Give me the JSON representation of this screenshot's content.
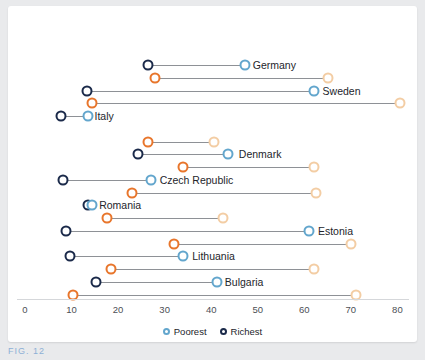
{
  "chart_data": {
    "type": "scatter",
    "title": "",
    "subtitle": "",
    "xlabel": "",
    "ylabel": "",
    "xlim": [
      0,
      80
    ],
    "xticks": [
      0,
      10,
      20,
      30,
      40,
      50,
      60,
      70,
      80
    ],
    "xtick_labels": [
      "0",
      "10",
      "20",
      "30",
      "40",
      "50",
      "60",
      "70",
      "80"
    ],
    "grid": false,
    "legend_position": "bottom",
    "legend": [
      {
        "name": "Poorest",
        "color": "#63a6cd"
      },
      {
        "name": "Richest",
        "color": "#1b2a4a"
      }
    ],
    "series": [
      {
        "name": "Poorest",
        "color": "#63a6cd"
      },
      {
        "name": "Richest",
        "color": "#1b2a4a"
      },
      {
        "name": "Poorest (secondary)",
        "color": "#f3cda4"
      },
      {
        "name": "Richest (secondary)",
        "color": "#e8762c"
      }
    ],
    "categories": [
      "Germany",
      "Sweden",
      "Italy",
      "Denmark",
      "Czech Republic",
      "Romania",
      "Estonia",
      "Lithuania",
      "Bulgaria"
    ],
    "rows": [
      {
        "country": "Germany",
        "label_value": 47,
        "pairs": [
          {
            "series": "blue",
            "richest": 26.5,
            "poorest": 47.3
          },
          {
            "series": "orange",
            "richest": 28.0,
            "poorest": 65.0
          }
        ]
      },
      {
        "country": "Sweden",
        "label_value": 62,
        "pairs": [
          {
            "series": "blue",
            "richest": 13.3,
            "poorest": 62.0
          },
          {
            "series": "orange",
            "richest": 14.4,
            "poorest": 80.5
          }
        ]
      },
      {
        "country": "Italy",
        "label_value": 13,
        "pairs": [
          {
            "series": "blue",
            "richest": 7.7,
            "poorest": 13.5
          }
        ]
      },
      {
        "country": "Denmark",
        "label_value": 44,
        "pairs": [
          {
            "series": "orange",
            "richest": 26.5,
            "poorest": 40.5
          },
          {
            "series": "blue",
            "richest": 24.3,
            "poorest": 43.7
          }
        ]
      },
      {
        "country": "Czech Republic",
        "label_value": 27,
        "pairs": [
          {
            "series": "orange",
            "richest": 34.0,
            "poorest": 62.0
          },
          {
            "series": "blue",
            "richest": 8.2,
            "poorest": 27.0
          }
        ]
      },
      {
        "country": "Romania",
        "label_value": 14,
        "pairs": [
          {
            "series": "orange",
            "richest": 23.0,
            "poorest": 62.6
          },
          {
            "series": "blue",
            "richest": 13.5,
            "poorest": 14.4
          }
        ]
      },
      {
        "country": "Estonia",
        "label_value": 61,
        "pairs": [
          {
            "series": "orange",
            "richest": 17.6,
            "poorest": 42.6
          },
          {
            "series": "blue",
            "richest": 8.8,
            "poorest": 61.0
          }
        ]
      },
      {
        "country": "Lithuania",
        "label_value": 34,
        "pairs": [
          {
            "series": "orange",
            "richest": 32.0,
            "poorest": 70.0
          },
          {
            "series": "blue",
            "richest": 9.7,
            "poorest": 34.0
          }
        ]
      },
      {
        "country": "Bulgaria",
        "label_value": 41,
        "pairs": [
          {
            "series": "orange",
            "richest": 18.5,
            "poorest": 62.0
          },
          {
            "series": "blue",
            "richest": 15.3,
            "poorest": 41.3
          }
        ]
      },
      {
        "country": "",
        "label_value": 71,
        "pairs": [
          {
            "series": "orange",
            "richest": 10.3,
            "poorest": 71.0
          }
        ]
      }
    ]
  },
  "caption": {
    "text": "FIG. 12"
  }
}
